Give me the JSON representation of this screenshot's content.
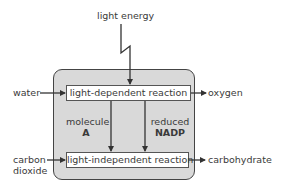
{
  "diagram": {
    "inputs": {
      "light": "light energy",
      "water": "water",
      "carbon_dioxide_line1": "carbon",
      "carbon_dioxide_line2": "dioxide"
    },
    "processes": {
      "light_dependent": "light-dependent reaction",
      "light_independent": "light-independent reaction"
    },
    "intermediates": {
      "molecule_a_line1": "molecule",
      "molecule_a_line2": "A",
      "nadp_line1": "reduced",
      "nadp_line2": "NADP"
    },
    "outputs": {
      "oxygen": "oxygen",
      "carbohydrate": "carbohydrate"
    },
    "colors": {
      "container_fill": "#d9d9d9",
      "stroke": "#444444",
      "box_fill": "#ffffff",
      "text": "#3a3a3a"
    }
  }
}
